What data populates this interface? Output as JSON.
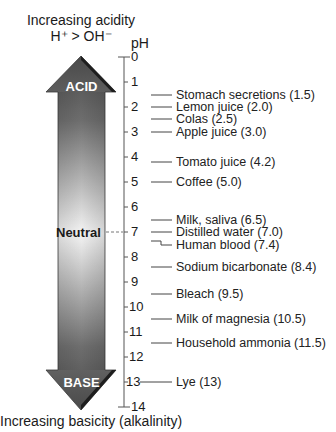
{
  "header": {
    "title_line1": "Increasing acidity",
    "title_line2": "H⁺ > OH⁻",
    "axis_unit": "pH"
  },
  "footer": {
    "title": "Increasing basicity (alkalinity)"
  },
  "arrow": {
    "top_label": "ACID",
    "middle_label": "Neutral",
    "bottom_label": "BASE",
    "colors": {
      "dark": "#5a5a5a",
      "light": "#f2f2f2",
      "edge": "#2b2b2b"
    }
  },
  "scale": {
    "ticks": [
      "0",
      "1",
      "2",
      "3",
      "4",
      "5",
      "6",
      "7",
      "8",
      "9",
      "10",
      "11",
      "12",
      "13",
      "14"
    ]
  },
  "items": [
    {
      "label": "Stomach secretions (1.5)",
      "ph": 1.5
    },
    {
      "label": "Lemon juice (2.0)",
      "ph": 2.0
    },
    {
      "label": "Colas (2.5)",
      "ph": 2.5
    },
    {
      "label": "Apple juice (3.0)",
      "ph": 3.0
    },
    {
      "label": "Tomato juice (4.2)",
      "ph": 4.2
    },
    {
      "label": "Coffee (5.0)",
      "ph": 5.0
    },
    {
      "label": "Milk, saliva (6.5)",
      "ph": 6.5
    },
    {
      "label": "Distilled water (7.0)",
      "ph": 7.0
    },
    {
      "label": "Human blood (7.4)",
      "ph": 7.4
    },
    {
      "label": "Sodium bicarbonate (8.4)",
      "ph": 8.4
    },
    {
      "label": "Bleach (9.5)",
      "ph": 9.5
    },
    {
      "label": "Milk of magnesia (10.5)",
      "ph": 10.5
    },
    {
      "label": "Household ammonia (11.5)",
      "ph": 11.5
    },
    {
      "label": "Lye (13)",
      "ph": 13
    }
  ]
}
